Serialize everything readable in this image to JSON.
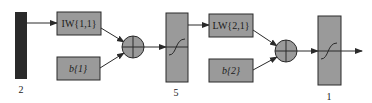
{
  "diagram": {
    "type": "two-layer neural network block diagram",
    "colors": {
      "input_bar": "#2a2a2a",
      "block_fill": "#9a9a9a",
      "stroke": "#2a2a2a",
      "background": "#ffffff"
    },
    "input": {
      "size_label": "2"
    },
    "layer1": {
      "weight_label": "IW{1,1}",
      "bias_label": "b{1}",
      "summer_icon": "sum-circle-plus",
      "transfer_icon": "sigmoid-curve",
      "size_label": "5"
    },
    "layer2": {
      "weight_label": "LW{2,1}",
      "bias_label": "b{2}",
      "summer_icon": "sum-circle-plus",
      "transfer_icon": "sigmoid-curve",
      "size_label": "1"
    }
  }
}
